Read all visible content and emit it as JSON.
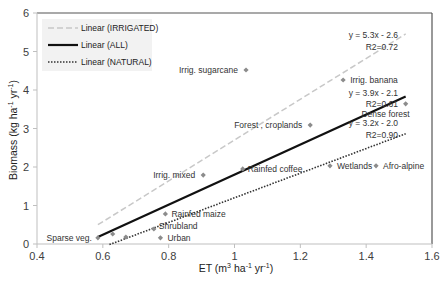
{
  "chart_data": {
    "type": "scatter",
    "title": "",
    "xlabel": "ET (m³ ha⁻¹ yr⁻¹)",
    "ylabel": "Biomass (kg ha⁻¹ yr⁻¹)",
    "xlim": [
      0.4,
      1.6
    ],
    "ylim": [
      0,
      6
    ],
    "xticks": [
      0.4,
      0.6,
      0.8,
      1,
      1.2,
      1.4,
      1.6
    ],
    "xtick_labels": [
      "0.4",
      "0.6",
      "0.8",
      "1",
      "1.2",
      "1.4",
      "1.6"
    ],
    "yticks": [
      0,
      1,
      2,
      3,
      4,
      5,
      6
    ],
    "ytick_labels": [
      "0",
      "1",
      "2",
      "3",
      "4",
      "5",
      "6"
    ],
    "grid": false,
    "legend_position": "top-left",
    "marker_color": "#8c8c8c",
    "points": [
      {
        "label": "Sparse veg.",
        "x": 0.585,
        "y": 0.16
      },
      {
        "label": "",
        "x": 0.63,
        "y": 0.26
      },
      {
        "label": "",
        "x": 0.67,
        "y": 0.18
      },
      {
        "label": "Shrubland",
        "x": 0.755,
        "y": 0.39
      },
      {
        "label": "Urban",
        "x": 0.775,
        "y": 0.16
      },
      {
        "label": "Rainfed maize",
        "x": 0.79,
        "y": 0.78
      },
      {
        "label": "Irrig. mixed",
        "x": 0.905,
        "y": 1.79
      },
      {
        "label": "Rainfed coffee",
        "x": 1.025,
        "y": 1.95
      },
      {
        "label": "Irrig. sugarcane",
        "x": 1.035,
        "y": 4.52
      },
      {
        "label": "Forest , croplands",
        "x": 1.23,
        "y": 3.09
      },
      {
        "label": "Wetlands",
        "x": 1.29,
        "y": 2.03
      },
      {
        "label": "Irrig. banana",
        "x": 1.33,
        "y": 4.26
      },
      {
        "label": "Afro-alpine",
        "x": 1.43,
        "y": 2.03
      },
      {
        "label": "Dense forest",
        "x": 1.52,
        "y": 3.64
      }
    ],
    "trendlines": [
      {
        "name": "Linear (IRRIGATED)",
        "style": "dashed",
        "color": "#c8c8c8",
        "slope": 5.3,
        "intercept": -2.6,
        "x_range": [
          0.585,
          1.52
        ],
        "equation": "y = 5.3x - 2.6",
        "r2": "R2=0.72"
      },
      {
        "name": "Linear (ALL)",
        "style": "solid",
        "color": "#111111",
        "slope": 3.9,
        "intercept": -2.1,
        "x_range": [
          0.585,
          1.52
        ],
        "equation": "y = 3.9x - 2.1",
        "r2": "R2=0.61"
      },
      {
        "name": "Linear (NATURAL)",
        "style": "dotted",
        "color": "#333333",
        "slope": 3.2,
        "intercept": -2.0,
        "x_range": [
          0.62,
          1.52
        ],
        "equation": "y = 3.2x - 2.0",
        "r2": "R2=0.90"
      }
    ]
  }
}
